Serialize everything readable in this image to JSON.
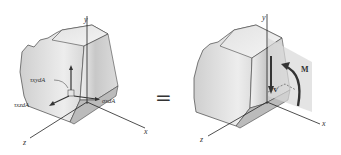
{
  "figure": {
    "left_panel": {
      "axes": {
        "x": "x",
        "y": "y",
        "z": "z"
      },
      "labels": {
        "tau_xy": "τxydA",
        "tau_xz": "τxzdA",
        "sigma_x": "σxdA"
      }
    },
    "equals_sign": "=",
    "right_panel": {
      "axes": {
        "x": "x",
        "y": "y",
        "z": "z"
      },
      "labels": {
        "shear": "V",
        "moment": "M"
      }
    }
  }
}
